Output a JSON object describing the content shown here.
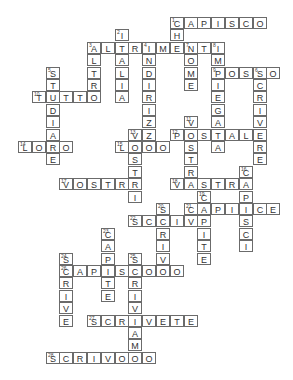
{
  "puzzle": {
    "type": "crossword",
    "grid_origin": {
      "x": 18,
      "y": 17,
      "col_step": 13.8,
      "row_step": 12.4
    },
    "words": [
      {
        "number": "1",
        "word": "CAPISCO",
        "dir": "across",
        "row": 0,
        "col": 11
      },
      {
        "number": "1",
        "word": "CHE",
        "dir": "down",
        "row": 0,
        "col": 11
      },
      {
        "number": "2",
        "word": "ITALIA",
        "dir": "down",
        "row": 1,
        "col": 7
      },
      {
        "number": "3",
        "word": "ALTRIMENTI",
        "dir": "across",
        "row": 2,
        "col": 5
      },
      {
        "number": "3",
        "word": "ALTRO",
        "dir": "down",
        "row": 2,
        "col": 5
      },
      {
        "number": "4",
        "word": "INDIRIZZO",
        "dir": "down",
        "row": 2,
        "col": 9
      },
      {
        "number": "7",
        "word": "NOME",
        "dir": "down",
        "row": 2,
        "col": 12
      },
      {
        "number": "8",
        "word": "IMPIEGATA",
        "dir": "down",
        "row": 2,
        "col": 14
      },
      {
        "number": "5",
        "word": "STUDIARE",
        "dir": "down",
        "row": 4,
        "col": 2
      },
      {
        "number": "9",
        "word": "POSSO",
        "dir": "across",
        "row": 4,
        "col": 14
      },
      {
        "number": "6",
        "word": "SCRIVERE",
        "dir": "down",
        "row": 4,
        "col": 17
      },
      {
        "number": "10",
        "word": "TUTTO",
        "dir": "across",
        "row": 6,
        "col": 1
      },
      {
        "number": "11",
        "word": "VOSTRA",
        "dir": "down",
        "row": 8,
        "col": 12
      },
      {
        "number": "12",
        "word": "POSTALE",
        "dir": "across",
        "row": 9,
        "col": 11
      },
      {
        "number": "13",
        "word": "VOSTRI",
        "dir": "down",
        "row": 9,
        "col": 8
      },
      {
        "number": "14",
        "word": "LORO",
        "dir": "across",
        "row": 10,
        "col": 0
      },
      {
        "number": "15",
        "word": "LORO",
        "dir": "across",
        "row": 10,
        "col": 7
      },
      {
        "number": "16",
        "word": "CAPISCI",
        "dir": "down",
        "row": 12,
        "col": 16
      },
      {
        "number": "17",
        "word": "VOSTRE",
        "dir": "across",
        "row": 13,
        "col": 3
      },
      {
        "number": "18",
        "word": "VOSTRA",
        "dir": "across",
        "row": 13,
        "col": 11
      },
      {
        "number": "19",
        "word": "CAPITE",
        "dir": "down",
        "row": 14,
        "col": 13
      },
      {
        "number": "20",
        "word": "SCRIVO",
        "dir": "down",
        "row": 15,
        "col": 10
      },
      {
        "number": "21",
        "word": "CAPISCE",
        "dir": "across",
        "row": 15,
        "col": 12
      },
      {
        "number": "22",
        "word": "SCRIVI",
        "dir": "across",
        "row": 16,
        "col": 8
      },
      {
        "number": "23",
        "word": "CAPITE",
        "dir": "down",
        "row": 17,
        "col": 6
      },
      {
        "number": "24",
        "word": "SCRIVE",
        "dir": "down",
        "row": 19,
        "col": 3
      },
      {
        "number": "25",
        "word": "SCRIVIAMO",
        "dir": "down",
        "row": 19,
        "col": 8
      },
      {
        "number": "26",
        "word": "CAPISCONO",
        "dir": "across",
        "row": 20,
        "col": 3
      },
      {
        "number": "27",
        "word": "SCRIVETE",
        "dir": "across",
        "row": 24,
        "col": 5
      },
      {
        "number": "28",
        "word": "SCRIVONO",
        "dir": "across",
        "row": 27,
        "col": 2
      }
    ]
  },
  "colors": {
    "border": "#6b6b6b",
    "text": "#333333",
    "background": "#ffffff"
  }
}
